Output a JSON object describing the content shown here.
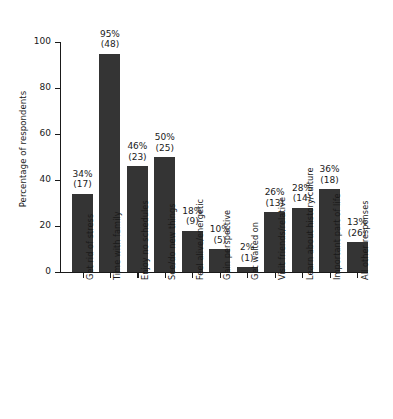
{
  "chart_data": {
    "type": "bar",
    "title": "",
    "xlabel": "",
    "ylabel": "Percentage of respondents",
    "ylim": [
      0,
      100
    ],
    "yticks": [
      0,
      20,
      40,
      60,
      80,
      100
    ],
    "ytick_labels": [
      "0",
      "20",
      "40",
      "60",
      "80",
      "100"
    ],
    "grid": false,
    "legend": null,
    "bar_color": "#343434",
    "categories": [
      "Get rid of stress",
      "Time with family",
      "Enjoy no schedules",
      "See/do new things",
      "Feel alive/energetic",
      "Gain perspective",
      "Get waited on",
      "Visit friends/relative",
      "Learn about history/culture",
      "Important part of life",
      "All other responses"
    ],
    "values": [
      34,
      95,
      46,
      50,
      18,
      10,
      2,
      26,
      28,
      36,
      13
    ],
    "counts": [
      17,
      48,
      23,
      25,
      9,
      5,
      1,
      13,
      14,
      18,
      26
    ],
    "data_labels": [
      {
        "percent": "34%",
        "count": "(17)"
      },
      {
        "percent": "95%",
        "count": "(48)"
      },
      {
        "percent": "46%",
        "count": "(23)"
      },
      {
        "percent": "50%",
        "count": "(25)"
      },
      {
        "percent": "18%",
        "count": "(9)"
      },
      {
        "percent": "10%",
        "count": "(5)"
      },
      {
        "percent": "2%",
        "count": "(1)"
      },
      {
        "percent": "26%",
        "count": "(13)"
      },
      {
        "percent": "28%",
        "count": "(14)"
      },
      {
        "percent": "36%",
        "count": "(18)"
      },
      {
        "percent": "13%",
        "count": "(26)"
      }
    ]
  }
}
